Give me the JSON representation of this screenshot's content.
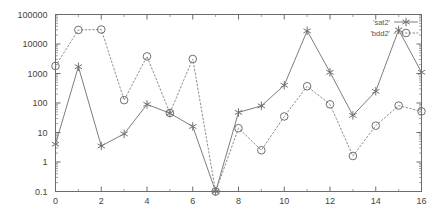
{
  "chart_data": {
    "type": "line",
    "title": "",
    "xlabel": "",
    "ylabel": "",
    "xlim": [
      0,
      16
    ],
    "ylim": [
      0.1,
      100000
    ],
    "yscale": "log",
    "xscale": "linear",
    "grid": false,
    "legend_position": "top-right",
    "x": [
      0,
      1,
      2,
      3,
      4,
      5,
      6,
      7,
      8,
      9,
      10,
      11,
      12,
      13,
      14,
      15,
      16
    ],
    "xtick_labels": [
      "0",
      "2",
      "4",
      "6",
      "8",
      "10",
      "12",
      "14",
      "16"
    ],
    "xtick_values": [
      0,
      2,
      4,
      6,
      8,
      10,
      12,
      14,
      16
    ],
    "ytick_labels": [
      "0.1",
      "1",
      "10",
      "100",
      "1000",
      "10000",
      "100000"
    ],
    "ytick_values": [
      0.1,
      1,
      10,
      100,
      1000,
      10000,
      100000
    ],
    "series": [
      {
        "name": "'sat2'",
        "marker": "star",
        "linestyle": "solid",
        "values": [
          4,
          1700,
          3.5,
          9,
          90,
          45,
          16,
          0.1,
          48,
          80,
          400,
          28000,
          1100,
          38,
          250,
          30000,
          1100
        ]
      },
      {
        "name": "'bdd2'",
        "marker": "circle",
        "linestyle": "dotted",
        "values": [
          1800,
          30000,
          31000,
          125,
          3800,
          46,
          3100,
          0.1,
          14,
          2.5,
          35,
          370,
          90,
          1.6,
          17,
          82,
          52
        ]
      }
    ]
  },
  "legend": {
    "entries": [
      {
        "label": "'sat2'",
        "marker": "star",
        "linestyle": "solid"
      },
      {
        "label": "'bdd2'",
        "marker": "circle",
        "linestyle": "dotted"
      }
    ]
  },
  "colors": {
    "axis": "#6b6b6b",
    "series_sat2": "#7d7d7d",
    "series_bdd2": "#8e8e8e",
    "background": "#ffffff",
    "text": "#444444"
  }
}
